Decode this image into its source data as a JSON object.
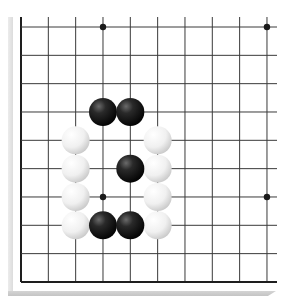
{
  "game": "Go",
  "board": {
    "visible_columns": 10,
    "visible_rows": 10,
    "origin_px": [
      21,
      27
    ],
    "col_spacing_px": 27.33,
    "row_spacing_px": 28.33,
    "right_edge_px": 277,
    "top_edge_px": 17,
    "left_border": true,
    "bottom_border": true,
    "line_color": "#3a3a3a",
    "border_color": "#1e1e1e",
    "background": "#ffffff"
  },
  "star_points": [
    {
      "col": 3,
      "row": 0
    },
    {
      "col": 9,
      "row": 0
    },
    {
      "col": 3,
      "row": 6
    },
    {
      "col": 9,
      "row": 6
    }
  ],
  "stones": {
    "black": [
      {
        "col": 3,
        "row": 3
      },
      {
        "col": 4,
        "row": 3
      },
      {
        "col": 4,
        "row": 5
      },
      {
        "col": 3,
        "row": 7
      },
      {
        "col": 4,
        "row": 7
      }
    ],
    "white": [
      {
        "col": 2,
        "row": 4
      },
      {
        "col": 2,
        "row": 5
      },
      {
        "col": 2,
        "row": 6
      },
      {
        "col": 2,
        "row": 7
      },
      {
        "col": 5,
        "row": 4
      },
      {
        "col": 5,
        "row": 5
      },
      {
        "col": 5,
        "row": 6
      },
      {
        "col": 5,
        "row": 7
      }
    ]
  },
  "colors": {
    "black_stone": "#1a1a1a",
    "white_stone": "#f4f4f4",
    "star_point": "#1a1a1a"
  }
}
